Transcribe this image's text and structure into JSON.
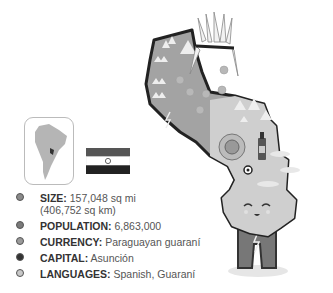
{
  "facts": [
    {
      "label": "SIZE:",
      "value": "157,048 sq mi",
      "value2": "(406,752 sq km)",
      "dot_color": "#8a8a8a"
    },
    {
      "label": "POPULATION:",
      "value": "6,863,000",
      "dot_color": "#7a7a7a"
    },
    {
      "label": "CURRENCY:",
      "value": "Paraguayan guaraní",
      "dot_color": "#9a9a9a"
    },
    {
      "label": "CAPITAL:",
      "value": "Asunción",
      "dot_color": "#333333"
    },
    {
      "label": "LANGUAGES:",
      "value": "Spanish, Guaraní",
      "dot_color": "#c8c8c8"
    }
  ],
  "icons": {
    "locator": "south-america-locator-map",
    "flag": "paraguay-flag",
    "illustration": "paraguay-character-map"
  }
}
